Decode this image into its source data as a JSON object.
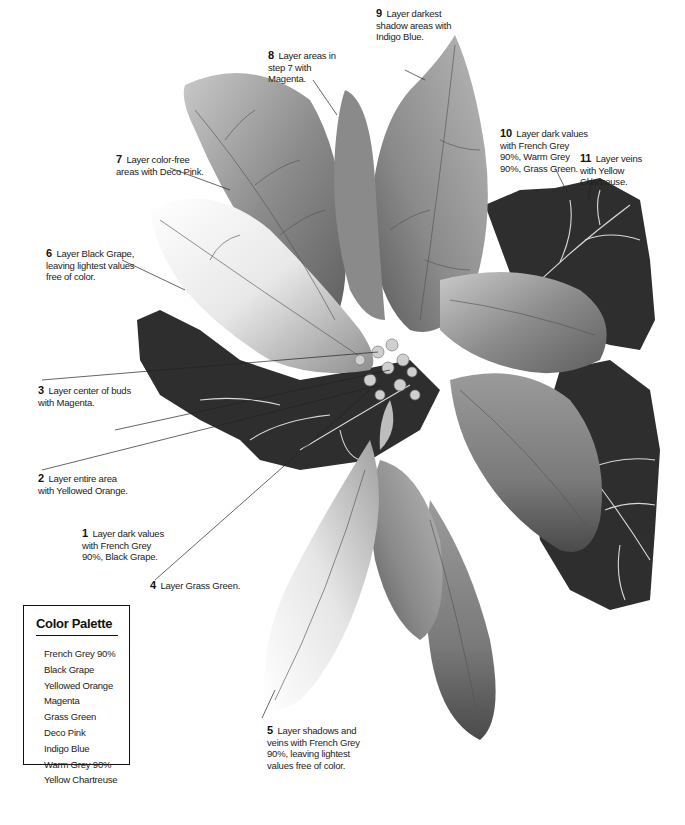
{
  "illustration": {
    "subject": "Poinsettia colored pencil drawing",
    "colors": {
      "ink": "#111111",
      "dark_leaf": "#2b2b2b",
      "mid_leaf": "#8a8a8a",
      "light_petal": "#d9d9d9",
      "background": "#ffffff"
    }
  },
  "callouts": [
    {
      "num": "1",
      "text": "Layer dark values with French Grey 90%, Black Grape."
    },
    {
      "num": "2",
      "text": "Layer entire area with Yellowed Orange."
    },
    {
      "num": "3",
      "text": "Layer center of buds with Magenta."
    },
    {
      "num": "4",
      "text": "Layer Grass Green."
    },
    {
      "num": "5",
      "text": "Layer shadows and veins with French Grey 90%, leaving lightest values free of color."
    },
    {
      "num": "6",
      "text": "Layer Black Grape, leaving lightest values free of color."
    },
    {
      "num": "7",
      "text": "Layer color-free areas with Deco Pink."
    },
    {
      "num": "8",
      "text": "Layer areas in step 7 with Magenta."
    },
    {
      "num": "9",
      "text": "Layer darkest shadow areas with Indigo Blue."
    },
    {
      "num": "10",
      "text": "Layer dark values with French Grey 90%, Warm Grey 90%, Grass Green."
    },
    {
      "num": "11",
      "text": "Layer veins with Yellow Chartreuse."
    }
  ],
  "palette": {
    "title": "Color Palette",
    "items": [
      "French Grey 90%",
      "Black Grape",
      "Yellowed Orange",
      "Magenta",
      "Grass Green",
      "Deco Pink",
      "Indigo Blue",
      "Warm Grey 90%",
      "Yellow Chartreuse"
    ]
  }
}
